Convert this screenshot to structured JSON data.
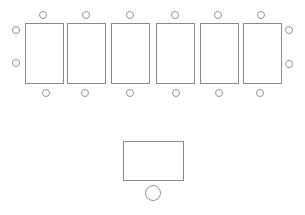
{
  "diagram": {
    "title": "",
    "stroke_color": "#888888",
    "tables": [
      {
        "id": "table-1",
        "x": 25,
        "y": 23,
        "w": 38,
        "h": 60
      },
      {
        "id": "table-2",
        "x": 67,
        "y": 23,
        "w": 38,
        "h": 60
      },
      {
        "id": "table-3",
        "x": 111,
        "y": 23,
        "w": 38,
        "h": 60
      },
      {
        "id": "table-4",
        "x": 156,
        "y": 23,
        "w": 38,
        "h": 60
      },
      {
        "id": "table-5",
        "x": 200,
        "y": 23,
        "w": 38,
        "h": 60
      },
      {
        "id": "table-6",
        "x": 243,
        "y": 23,
        "w": 38,
        "h": 60
      }
    ],
    "seats": [
      {
        "cx": 43,
        "cy": 15,
        "r": 3.5
      },
      {
        "cx": 86,
        "cy": 15,
        "r": 3.5
      },
      {
        "cx": 130,
        "cy": 15,
        "r": 3.5
      },
      {
        "cx": 175,
        "cy": 15,
        "r": 3.5
      },
      {
        "cx": 218,
        "cy": 15,
        "r": 3.5
      },
      {
        "cx": 261,
        "cy": 15,
        "r": 3.5
      },
      {
        "cx": 46,
        "cy": 93,
        "r": 3.5
      },
      {
        "cx": 85,
        "cy": 93,
        "r": 3.5
      },
      {
        "cx": 130,
        "cy": 93,
        "r": 3.5
      },
      {
        "cx": 176,
        "cy": 93,
        "r": 3.5
      },
      {
        "cx": 219,
        "cy": 93,
        "r": 3.5
      },
      {
        "cx": 260,
        "cy": 93,
        "r": 3.5
      },
      {
        "cx": 16,
        "cy": 30,
        "r": 3.5
      },
      {
        "cx": 16,
        "cy": 63,
        "r": 3.5
      },
      {
        "cx": 289,
        "cy": 30,
        "r": 3.5
      },
      {
        "cx": 289,
        "cy": 64,
        "r": 3.5
      }
    ],
    "front_desk": {
      "x": 123,
      "y": 141,
      "w": 60,
      "h": 39
    },
    "front_seat": {
      "cx": 153,
      "cy": 193,
      "r": 7.5
    }
  }
}
